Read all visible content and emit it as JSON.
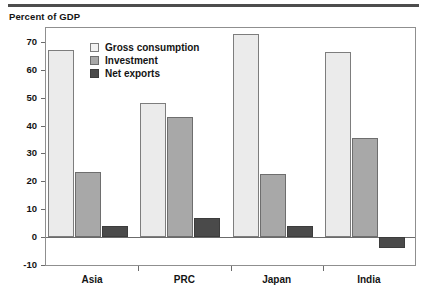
{
  "header": {
    "axis_title": "Percent of GDP"
  },
  "chart_data": {
    "type": "bar",
    "title": "",
    "subtitle": "",
    "xlabel": "",
    "ylabel": "Percent of GDP",
    "categories": [
      "Asia",
      "PRC",
      "Japan",
      "India"
    ],
    "series": [
      {
        "name": "Gross consumption",
        "color": "#ebebeb",
        "values": [
          67,
          48,
          73,
          66.5
        ]
      },
      {
        "name": "Investment",
        "color": "#a8a8a8",
        "values": [
          23.5,
          43,
          22.5,
          35.5
        ]
      },
      {
        "name": "Net exports",
        "color": "#4a4a4a",
        "values": [
          4,
          7,
          4,
          -4
        ]
      }
    ],
    "ylim": [
      -10,
      75
    ],
    "yticks": [
      -10,
      0,
      10,
      20,
      30,
      40,
      50,
      60,
      70
    ],
    "ytick_labels": [
      "-10",
      "0",
      "10",
      "20",
      "30",
      "40",
      "50",
      "60",
      "70"
    ],
    "grid": false,
    "legend_position": "top-left-inside"
  },
  "legend": {
    "entries": [
      {
        "label": "Gross consumption"
      },
      {
        "label": "Investment"
      },
      {
        "label": "Net exports"
      }
    ]
  }
}
